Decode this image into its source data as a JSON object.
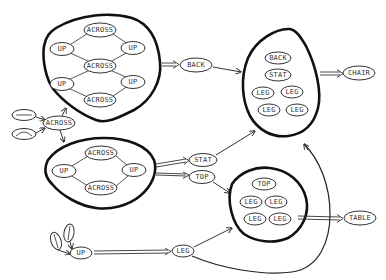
{
  "diagram": {
    "type": "hierarchical object composition graph",
    "colors": {
      "ink": "#222222",
      "background": "#ffffff"
    },
    "groups": {
      "upper_assembly": {
        "nodes": [
          "ACROSS",
          "UP",
          "UP",
          "ACROSS",
          "UP",
          "UP",
          "ACROSS"
        ]
      },
      "lower_assembly": {
        "nodes": [
          "ACROSS",
          "UP",
          "UP",
          "ACROSS"
        ]
      },
      "chair_parts": {
        "nodes": [
          "BACK",
          "STAT",
          "LEG",
          "LEG",
          "LEG",
          "LEG"
        ]
      },
      "table_parts": {
        "nodes": [
          "TOP",
          "LEG",
          "LEG",
          "LEG",
          "LEG"
        ]
      }
    },
    "labels": {
      "across_top1": "ACROSS",
      "up_tl": "UP",
      "up_tr": "UP",
      "across_mid": "ACROSS",
      "up_bl": "UP",
      "up_br": "UP",
      "across_bot1": "ACROSS",
      "across_input": "ACROSS",
      "back": "BACK",
      "stat": "STAT",
      "top": "TOP",
      "leg": "LEG",
      "chair": "CHAIR",
      "table": "TABLE",
      "up_input": "UP",
      "lower_across_top": "ACROSS",
      "lower_up_left": "UP",
      "lower_up_right": "UP",
      "lower_across_bot": "ACROSS",
      "chair_back": "BACK",
      "chair_stat": "STAT",
      "chair_leg1": "LEG",
      "chair_leg2": "LEG",
      "chair_leg3": "LEG",
      "chair_leg4": "LEG",
      "table_top": "TOP",
      "table_leg1": "LEG",
      "table_leg2": "LEG",
      "table_leg3": "LEG",
      "table_leg4": "LEG"
    },
    "edges": [
      {
        "from": "horizontal-line-primitive",
        "to": "ACROSS"
      },
      {
        "from": "curve-primitive",
        "to": "ACROSS"
      },
      {
        "from": "ACROSS",
        "to": "upper_assembly"
      },
      {
        "from": "ACROSS",
        "to": "lower_assembly"
      },
      {
        "from": "upper_assembly",
        "to": "BACK",
        "style": "double"
      },
      {
        "from": "BACK",
        "to": "chair_parts"
      },
      {
        "from": "lower_assembly",
        "to": "STAT",
        "style": "double"
      },
      {
        "from": "lower_assembly",
        "to": "TOP",
        "style": "double"
      },
      {
        "from": "STAT",
        "to": "chair_parts"
      },
      {
        "from": "TOP",
        "to": "table_parts"
      },
      {
        "from": "vertical-line-primitive",
        "to": "UP"
      },
      {
        "from": "vertical-line-primitive",
        "to": "UP"
      },
      {
        "from": "UP",
        "to": "LEG",
        "style": "double"
      },
      {
        "from": "LEG",
        "to": "table_parts"
      },
      {
        "from": "LEG",
        "to": "chair_parts"
      },
      {
        "from": "chair_parts",
        "to": "CHAIR",
        "style": "double"
      },
      {
        "from": "table_parts",
        "to": "TABLE",
        "style": "double"
      }
    ]
  }
}
